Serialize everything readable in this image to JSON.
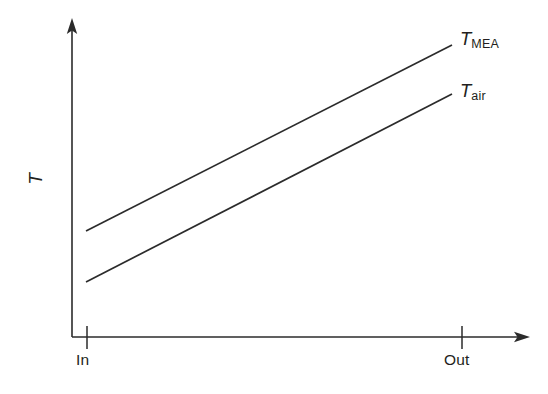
{
  "figure": {
    "background_color": "#ffffff",
    "ink_color": "#2b2b2b",
    "width": 548,
    "height": 394
  },
  "axes": {
    "y_label": "T",
    "y_label_name": "temperature-axis-label",
    "x_ticks": [
      {
        "label": "In",
        "position": 0
      },
      {
        "label": "Out",
        "position": 1
      }
    ],
    "x_label": "",
    "y_arrow": true,
    "x_arrow": true
  },
  "series_labels": {
    "mea": {
      "symbol": "T",
      "subscript": "MEA"
    },
    "air": {
      "symbol": "T",
      "subscript": "air"
    }
  },
  "chart_data": {
    "type": "line",
    "title": "",
    "xlabel": "",
    "ylabel": "T",
    "grid": false,
    "legend": "inline-right-end-of-line",
    "x": [
      "In",
      "Out"
    ],
    "xlim": [
      "In",
      "Out"
    ],
    "ylim": [
      0,
      1
    ],
    "annotations": [
      "T_MEA lies above T_air across the whole length",
      "Both temperatures rise linearly from In to Out",
      "The vertical gap between the two lines is approximately constant"
    ],
    "series": [
      {
        "name": "T_MEA",
        "label": "T MEA",
        "values": [
          0.335,
          0.921
        ],
        "pixel_points": [
          [
            86,
            231
          ],
          [
            452,
            45
          ]
        ],
        "color": "#2b2b2b",
        "style": "solid"
      },
      {
        "name": "T_air",
        "label": "T air",
        "values": [
          0.174,
          0.766
        ],
        "pixel_points": [
          [
            86,
            282
          ],
          [
            452,
            94
          ]
        ],
        "color": "#2b2b2b",
        "style": "solid"
      }
    ]
  }
}
